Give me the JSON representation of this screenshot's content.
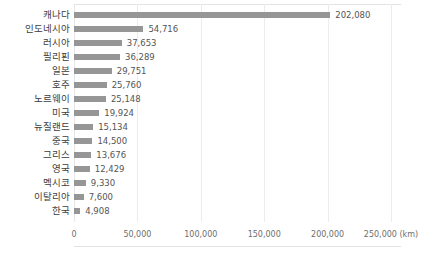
{
  "chart_data": {
    "type": "bar",
    "orientation": "horizontal",
    "title": "",
    "subtitle": "",
    "xlabel": "(km)",
    "ylabel": "",
    "unit": "km",
    "xlim": [
      0,
      250000
    ],
    "grid": true,
    "legend": null,
    "bar_color": "#969696",
    "categories": [
      "캐나다",
      "인도네시아",
      "러시아",
      "필리핀",
      "일본",
      "호주",
      "노르웨이",
      "미국",
      "뉴질랜드",
      "중국",
      "그리스",
      "영국",
      "멕시코",
      "이탈리아",
      "한국"
    ],
    "values": [
      202080,
      54716,
      37653,
      36289,
      29751,
      25760,
      25148,
      19924,
      15134,
      14500,
      13676,
      12429,
      9330,
      7600,
      4908
    ],
    "value_labels": [
      "202,080",
      "54,716",
      "37,653",
      "36,289",
      "29,751",
      "25,760",
      "25,148",
      "19,924",
      "15,134",
      "14,500",
      "13,676",
      "12,429",
      "9,330",
      "7,600",
      "4,908"
    ],
    "xticks": [
      0,
      50000,
      100000,
      150000,
      200000,
      250000
    ],
    "xtick_labels": [
      "0",
      "50,000",
      "100,000",
      "150,000",
      "200,000",
      "250,000 (km)"
    ]
  }
}
